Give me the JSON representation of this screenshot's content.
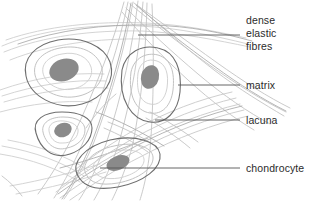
{
  "diagram": {
    "background_color": "#ffffff",
    "annotations": [
      {
        "name": "dense-elastic-fibres",
        "lines": [
          "dense",
          "elastic",
          "fibres"
        ],
        "leader": {
          "x1": 138,
          "y1": 35,
          "x2": 240,
          "y2": 35
        }
      },
      {
        "name": "matrix",
        "lines": [
          "matrix"
        ],
        "leader": {
          "x1": 178,
          "y1": 85,
          "x2": 240,
          "y2": 85
        }
      },
      {
        "name": "lacuna",
        "lines": [
          "lacuna"
        ],
        "leader": {
          "x1": 155,
          "y1": 120,
          "x2": 240,
          "y2": 120
        }
      },
      {
        "name": "chondrocyte",
        "lines": [
          "chondrocyte"
        ],
        "leader": {
          "x1": 100,
          "y1": 168,
          "x2": 240,
          "y2": 168
        }
      }
    ],
    "colors": {
      "lacuna_outline": "#6e6e6e",
      "inner_ring": "#b9b9b9",
      "nucleus_fill": "#8a8a8a",
      "fibre_light": "#c9c9c9",
      "fibre_mid": "#aeaeae",
      "leader_line": "#555555",
      "text": "#2b2b2b"
    },
    "cells": [
      {
        "name": "chondrocyte-top-left",
        "cx": 62,
        "cy": 73,
        "nucleus_cx": 58,
        "nucleus_cy": 67
      },
      {
        "name": "chondrocyte-center",
        "cx": 150,
        "cy": 90,
        "nucleus_cx": 148,
        "nucleus_cy": 79
      },
      {
        "name": "chondrocyte-lower-left",
        "cx": 62,
        "cy": 134,
        "nucleus_cx": 60,
        "nucleus_cy": 126
      },
      {
        "name": "chondrocyte-bottom",
        "cx": 116,
        "cy": 162,
        "nucleus_cx": 112,
        "nucleus_cy": 158
      }
    ]
  }
}
